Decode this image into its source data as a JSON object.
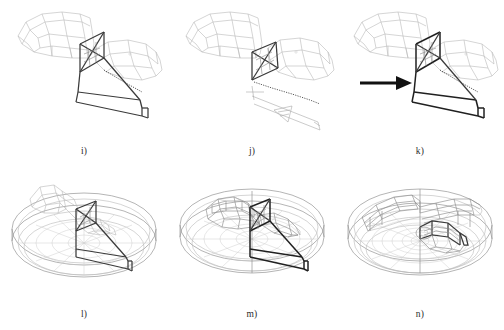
{
  "figure": {
    "kind": "multi-panel-wireframe-cad-figure",
    "background_color": "#ffffff",
    "panel_count": 6,
    "grid": {
      "columns": 3,
      "rows": 2
    },
    "line_colors": {
      "light_wireframe": "#b9b9b9",
      "medium_wireframe": "#8d8d8d",
      "dark_outline": "#3a3a3a",
      "darkest_outline": "#202020",
      "arrow": "#111111",
      "caption_text": "#2b2b2b"
    },
    "panels": [
      {
        "id": "panel-i",
        "caption": "i)",
        "row": 1,
        "column": 1,
        "scene": "duct-segment-wireframe",
        "has_arrow": false,
        "has_disk": false
      },
      {
        "id": "panel-j",
        "caption": "j)",
        "row": 1,
        "column": 2,
        "scene": "duct-segment-wireframe",
        "has_arrow": false,
        "has_disk": false
      },
      {
        "id": "panel-k",
        "caption": "k)",
        "row": 1,
        "column": 3,
        "scene": "duct-segment-wireframe",
        "has_arrow": true,
        "has_disk": false
      },
      {
        "id": "panel-l",
        "caption": "l)",
        "row": 2,
        "column": 1,
        "scene": "circular-domain-with-duct",
        "has_arrow": false,
        "has_disk": true
      },
      {
        "id": "panel-m",
        "caption": "m)",
        "row": 2,
        "column": 2,
        "scene": "circular-domain-with-duct",
        "has_arrow": false,
        "has_disk": true
      },
      {
        "id": "panel-n",
        "caption": "n)",
        "row": 2,
        "column": 3,
        "scene": "circular-domain-meshed",
        "has_arrow": false,
        "has_disk": true
      }
    ]
  }
}
